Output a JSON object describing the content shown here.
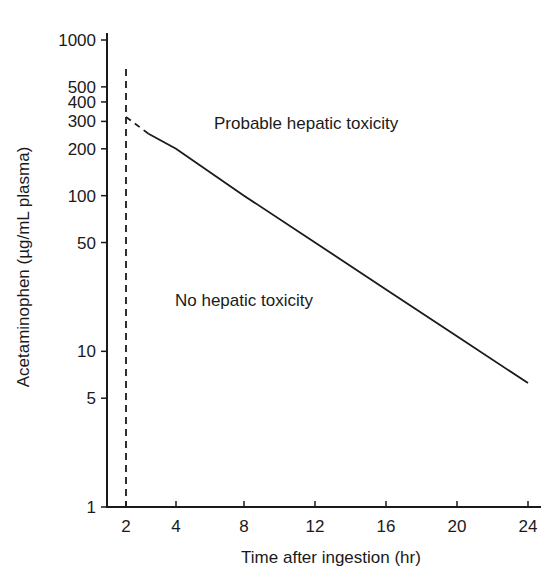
{
  "chart_data": {
    "type": "line",
    "title": "",
    "xlabel": "Time after ingestion (hr)",
    "ylabel": "Acetaminophen (µg/mL plasma)",
    "yscale": "log",
    "ylim": [
      1,
      1000
    ],
    "xlim": [
      0.8,
      25
    ],
    "grid": false,
    "legend": null,
    "x_ticks": [
      2,
      4,
      8,
      12,
      16,
      20,
      24
    ],
    "y_ticks": [
      1,
      5,
      10,
      50,
      100,
      200,
      300,
      400,
      500,
      1000
    ],
    "series": [
      {
        "name": "Treatment line (dashed extrapolation)",
        "style": "dashed",
        "x": [
          2,
          2.9
        ],
        "values": [
          320,
          250
        ]
      },
      {
        "name": "Treatment line",
        "style": "solid",
        "x": [
          2.9,
          4,
          8,
          12,
          16,
          20,
          24
        ],
        "values": [
          250,
          200,
          100,
          50,
          25,
          12.5,
          6.25
        ]
      }
    ],
    "reference_lines": [
      {
        "orientation": "vertical",
        "x": 2,
        "style": "dashed",
        "y_range": [
          1,
          650
        ]
      }
    ],
    "annotations": [
      {
        "text": "Probable hepatic toxicity",
        "region": "above line"
      },
      {
        "text": "No hepatic toxicity",
        "region": "below line"
      }
    ],
    "colors": {
      "line": "#1a1a1a",
      "axis": "#1a1a1a",
      "background": "#ffffff"
    }
  }
}
